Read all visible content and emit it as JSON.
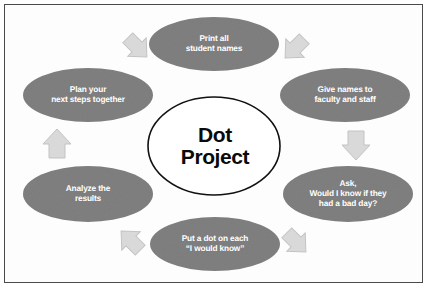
{
  "diagram": {
    "type": "cycle-diagram",
    "center": {
      "label": "Dot\nProject",
      "fill_color": "#ffffff",
      "stroke_color": "#111111",
      "text_color": "#0a0a0a"
    },
    "theme": {
      "node_fill": "#808080",
      "node_text": "#ffffff",
      "arrow_fill": "#d9d9d9",
      "arrow_stroke": "#c2c2c2",
      "background": "#fdfdfd",
      "border": "#4a4a4a"
    },
    "nodes": [
      {
        "id": "print-all-student-names",
        "label": "Print all\nstudent names",
        "position": "top",
        "cx": 214,
        "cy": 44,
        "rx": 65,
        "ry": 27
      },
      {
        "id": "give-names-to-faculty-and-staff",
        "label": "Give names to\nfaculty and staff",
        "position": "top-right",
        "cx": 345,
        "cy": 95,
        "rx": 65,
        "ry": 27
      },
      {
        "id": "ask-would-i-know",
        "label": "Ask,\nWould I know if they\nhad a bad day?",
        "position": "bottom-right",
        "cx": 348,
        "cy": 194,
        "rx": 65,
        "ry": 28
      },
      {
        "id": "put-a-dot-on-each",
        "label": "Put a dot on each\n“I would know”",
        "position": "bottom",
        "cx": 215,
        "cy": 244,
        "rx": 65,
        "ry": 27
      },
      {
        "id": "analyze-the-results",
        "label": "Analyze the\nresults",
        "position": "bottom-left",
        "cx": 88,
        "cy": 194,
        "rx": 65,
        "ry": 28
      },
      {
        "id": "plan-your-next-steps-together",
        "label": "Plan your\nnext steps together",
        "position": "top-left",
        "cx": 88,
        "cy": 95,
        "rx": 65,
        "ry": 27
      }
    ],
    "arrows": [
      {
        "id": "arrow-plan-to-print",
        "from": "plan-your-next-steps-together",
        "to": "print-all-student-names",
        "direction": "up-right"
      },
      {
        "id": "arrow-print-to-give",
        "from": "print-all-student-names",
        "to": "give-names-to-faculty-and-staff",
        "direction": "down-right"
      },
      {
        "id": "arrow-give-to-ask",
        "from": "give-names-to-faculty-and-staff",
        "to": "ask-would-i-know",
        "direction": "down"
      },
      {
        "id": "arrow-ask-to-put-dot",
        "from": "ask-would-i-know",
        "to": "put-a-dot-on-each",
        "direction": "down-left"
      },
      {
        "id": "arrow-put-dot-to-analyze",
        "from": "put-a-dot-on-each",
        "to": "analyze-the-results",
        "direction": "up-left"
      },
      {
        "id": "arrow-analyze-to-plan",
        "from": "analyze-the-results",
        "to": "plan-your-next-steps-together",
        "direction": "up"
      }
    ]
  }
}
